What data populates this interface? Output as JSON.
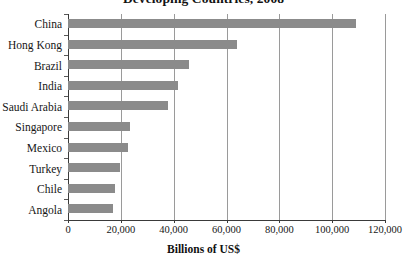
{
  "chart_data": {
    "type": "bar",
    "orientation": "horizontal",
    "title": "Developing Countries, 2008",
    "xlabel": "Billions of US$",
    "ylabel": "",
    "xlim": [
      0,
      120000
    ],
    "xticks": [
      0,
      20000,
      40000,
      60000,
      80000,
      100000,
      120000
    ],
    "xtick_labels": [
      "0",
      "20,000",
      "40,000",
      "60,000",
      "80,000",
      "100,000",
      "120,000"
    ],
    "grid": true,
    "legend": null,
    "categories": [
      "China",
      "Hong Kong",
      "Brazil",
      "India",
      "Saudi Arabia",
      "Singapore",
      "Mexico",
      "Turkey",
      "Chile",
      "Angola"
    ],
    "values": [
      109000,
      64000,
      45700,
      41500,
      37700,
      23400,
      22600,
      19600,
      17700,
      17000
    ],
    "series": [
      {
        "name": "Reserves",
        "color": "#8b8b8b",
        "values": [
          109000,
          64000,
          45700,
          41500,
          37700,
          23400,
          22600,
          19600,
          17700,
          17000
        ]
      }
    ]
  },
  "style": {
    "bar_color": "#8b8b8b",
    "gridline_color": "#9a9a9a",
    "axis_color": "#3a3a3a",
    "text_color": "#161616",
    "background": "#ffffff"
  }
}
